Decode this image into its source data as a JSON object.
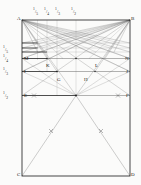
{
  "figure": {
    "kind": "geometric-construction",
    "background_color": "#fbfbfa",
    "ink_color": "#3a3a3a",
    "heavy_ink_color": "#111111",
    "label_color": "#1d1d1d"
  },
  "rect": {
    "left": 22,
    "right": 130,
    "top": 20,
    "bottom": 176
  },
  "corner_labels": [
    {
      "name": "A",
      "text": "A",
      "x": 17,
      "y": 16
    },
    {
      "name": "B",
      "text": "B",
      "x": 131,
      "y": 16
    },
    {
      "name": "C",
      "text": "C",
      "x": 17,
      "y": 172
    },
    {
      "name": "D",
      "text": "D",
      "x": 131,
      "y": 172
    }
  ],
  "interior_labels": [
    {
      "name": "K",
      "text": "K",
      "x": 46,
      "y": 63
    },
    {
      "name": "G",
      "text": "G",
      "x": 57,
      "y": 77
    },
    {
      "name": "H",
      "text": "H",
      "x": 84,
      "y": 77
    },
    {
      "name": "L",
      "text": "L",
      "x": 95,
      "y": 63
    }
  ],
  "edge_labels": [
    {
      "name": "M",
      "text": "M",
      "x": 24,
      "y": 59
    },
    {
      "name": "N",
      "text": "N",
      "x": 125,
      "y": 59
    },
    {
      "name": "I",
      "text": "I",
      "x": 24,
      "y": 72
    },
    {
      "name": "J",
      "text": "J",
      "x": 126,
      "y": 72
    },
    {
      "name": "E",
      "text": "E",
      "x": 24,
      "y": 96
    },
    {
      "name": "F",
      "text": "F",
      "x": 126,
      "y": 96
    }
  ],
  "left_fractions": [
    {
      "name": "one-fifth",
      "num": "1",
      "den": "5",
      "x": 3,
      "y": 49
    },
    {
      "name": "one-fourth",
      "num": "1",
      "den": "4",
      "x": 3,
      "y": 57
    },
    {
      "name": "one-third",
      "num": "1",
      "den": "3",
      "x": 3,
      "y": 71
    },
    {
      "name": "one-half",
      "num": "1",
      "den": "2",
      "x": 3,
      "y": 95
    }
  ],
  "top_fractions": [
    {
      "name": "one-fifth-top",
      "num": "1",
      "den": "5",
      "x": 35,
      "y": 8
    },
    {
      "name": "one-fourth-top",
      "num": "1",
      "den": "4",
      "x": 45,
      "y": 8
    },
    {
      "name": "one-third-top",
      "num": "1",
      "den": "3",
      "x": 55,
      "y": 8
    },
    {
      "name": "one-half-top",
      "num": "1",
      "den": "2",
      "x": 71,
      "y": 8
    }
  ],
  "horizontal_rules": [
    {
      "name": "rule-one-sixth",
      "y": 43,
      "weight": "light"
    },
    {
      "name": "rule-one-fifth",
      "y": 48,
      "weight": "light"
    },
    {
      "name": "rule-one-fourth-upper",
      "y": 52,
      "weight": "light"
    },
    {
      "name": "rule-MN",
      "y": 58.5,
      "weight": "heavy"
    },
    {
      "name": "rule-IJ",
      "y": 71.5,
      "weight": "heavy"
    },
    {
      "name": "rule-EF",
      "y": 95.5,
      "weight": "heavy"
    }
  ],
  "vertical_rules": [
    {
      "name": "vline-one-fifth",
      "x": 37.5
    },
    {
      "name": "vline-one-fourth",
      "x": 47
    },
    {
      "name": "vline-one-third",
      "x": 57
    },
    {
      "name": "vline-one-half",
      "x": 76
    }
  ],
  "tick_marks": [
    {
      "name": "tick-EF-left",
      "x": 34,
      "y": 95.5
    },
    {
      "name": "tick-EF-right",
      "x": 118,
      "y": 95.5
    },
    {
      "name": "tick-CE-mid",
      "x": 51,
      "y": 131
    },
    {
      "name": "tick-DF-mid",
      "x": 101,
      "y": 131
    }
  ]
}
